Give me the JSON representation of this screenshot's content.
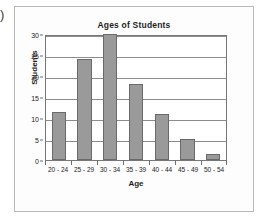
{
  "edge_glyph": ")",
  "chart_data": {
    "type": "bar",
    "title": "Ages of Students",
    "xlabel": "Age",
    "ylabel": "Students",
    "categories": [
      "20 - 24",
      "25 - 29",
      "30 - 34",
      "35 - 39",
      "40 - 44",
      "45 - 49",
      "50 - 54"
    ],
    "values": [
      11.5,
      24,
      30,
      18,
      11,
      5,
      1.5
    ],
    "ylim": [
      0,
      30
    ],
    "yticks": [
      0,
      5,
      10,
      15,
      20,
      25,
      30
    ],
    "ytick_labels": [
      "0",
      "5",
      "10",
      "15",
      "20",
      "25",
      "30"
    ],
    "grid": true,
    "legend": null,
    "bar_color": "#9a9a9a",
    "bar_edge_color": "#6a6a6a",
    "axis_color": "#777777",
    "gridline_color": "#8d8d8d"
  }
}
